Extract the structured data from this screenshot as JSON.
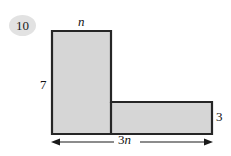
{
  "problem": {
    "number": "10"
  },
  "figure": {
    "shape_name": "l-shaped-polygon",
    "fill_color": "#d6d6d6",
    "stroke_color": "#262626",
    "badge_color": "#e2e2e2"
  },
  "labels": {
    "top": "n",
    "left": "7",
    "right": "3",
    "bottom_coefficient": "3",
    "bottom_variable": "n"
  },
  "dimension_arrow": {
    "name": "bottom-width-arrow",
    "double_headed": true
  }
}
